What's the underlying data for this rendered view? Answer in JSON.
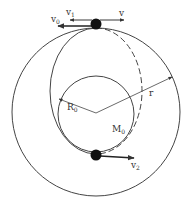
{
  "diagram": {
    "type": "orbital-transfer",
    "colors": {
      "line": "#444444",
      "ball": "#111111",
      "background": "#ffffff"
    },
    "labels": {
      "v0": {
        "main": "v",
        "sub": "0"
      },
      "v1": {
        "main": "v",
        "sub": "1"
      },
      "v": {
        "main": "v",
        "sub": ""
      },
      "v2": {
        "main": "v",
        "sub": "2"
      },
      "R0": {
        "main": "R",
        "sub": "0"
      },
      "r": {
        "main": "r",
        "sub": ""
      },
      "M0": {
        "main": "M",
        "sub": "0"
      }
    },
    "elements": {
      "outer_orbit": "circle of radius r (solid)",
      "planet": "central body of mass M0 and radius R0",
      "transfer_orbit": "ellipse, left half solid, right half dashed",
      "satellite_top": "satellite at apogee",
      "satellite_bottom": "satellite at perigee"
    }
  }
}
